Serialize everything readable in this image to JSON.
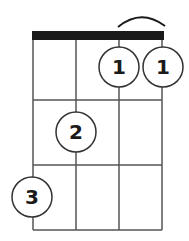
{
  "diagram": {
    "type": "ukulele-chord-diagram",
    "strings": 4,
    "frets_shown": 3,
    "barre": {
      "fret": 1,
      "from_string": 3,
      "to_string": 4,
      "label": "barre-arc"
    },
    "fingers": [
      {
        "string": 3,
        "fret": 1,
        "label": "1"
      },
      {
        "string": 4,
        "fret": 1,
        "label": "1"
      },
      {
        "string": 2,
        "fret": 2,
        "label": "2"
      },
      {
        "string": 1,
        "fret": 3,
        "label": "3"
      }
    ],
    "colors": {
      "line": "#555555",
      "nut": "#1a1a1a",
      "circle_fill": "#ffffff",
      "text": "#1a1a1a"
    }
  }
}
